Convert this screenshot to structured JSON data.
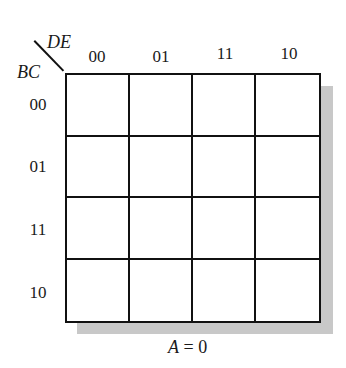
{
  "kmap": {
    "column_variables": "DE",
    "row_variables": "BC",
    "column_labels": [
      "00",
      "01",
      "11",
      "10"
    ],
    "row_labels": [
      "00",
      "01",
      "11",
      "10"
    ],
    "cells": [
      [
        "",
        "",
        "",
        ""
      ],
      [
        "",
        "",
        "",
        ""
      ],
      [
        "",
        "",
        "",
        ""
      ],
      [
        "",
        "",
        "",
        ""
      ]
    ],
    "caption_var": "A",
    "caption_rest": " = 0"
  }
}
